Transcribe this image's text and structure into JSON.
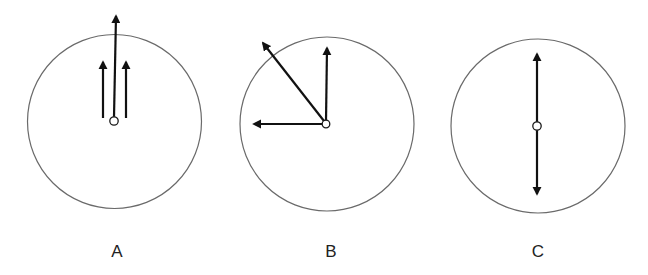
{
  "figure": {
    "panels": [
      {
        "id": "A",
        "label": "A",
        "circle": {
          "cx": 114.5,
          "cy": 121.5,
          "r": 87
        },
        "origin": {
          "cx": 114,
          "cy": 121,
          "r": 4.2
        },
        "arrows": [
          {
            "name": "long-center-arrow",
            "x1": 114,
            "y1": 117,
            "x2": 116,
            "y2": 16
          },
          {
            "name": "left-short-arrow",
            "x1": 103,
            "y1": 118,
            "x2": 103,
            "y2": 62
          },
          {
            "name": "right-short-arrow",
            "x1": 126,
            "y1": 118,
            "x2": 126,
            "y2": 62
          }
        ],
        "label_pos": {
          "x": 117,
          "y": 257
        }
      },
      {
        "id": "B",
        "label": "B",
        "circle": {
          "cx": 327,
          "cy": 124,
          "r": 87
        },
        "origin": {
          "cx": 326,
          "cy": 124,
          "r": 3.8
        },
        "arrows": [
          {
            "name": "up-arrow",
            "x1": 326,
            "y1": 121,
            "x2": 327,
            "y2": 48
          },
          {
            "name": "diagonal-arrow",
            "x1": 324,
            "y1": 121,
            "x2": 263,
            "y2": 43
          },
          {
            "name": "left-arrow",
            "x1": 322,
            "y1": 124,
            "x2": 254,
            "y2": 124
          }
        ],
        "label_pos": {
          "x": 331,
          "y": 257
        }
      },
      {
        "id": "C",
        "label": "C",
        "circle": {
          "cx": 538,
          "cy": 126,
          "r": 87
        },
        "origin": {
          "cx": 537,
          "cy": 126,
          "r": 4.2
        },
        "arrows": [
          {
            "name": "up-arrow",
            "x1": 537,
            "y1": 122,
            "x2": 537,
            "y2": 54
          },
          {
            "name": "down-arrow",
            "x1": 537,
            "y1": 130,
            "x2": 537,
            "y2": 194
          }
        ],
        "label_pos": {
          "x": 538,
          "y": 257
        }
      }
    ]
  }
}
